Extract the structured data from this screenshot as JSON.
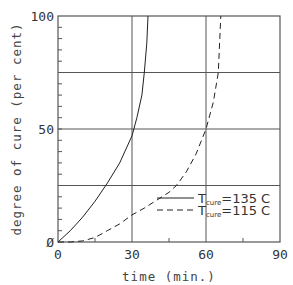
{
  "chart_data": {
    "type": "line",
    "title": "",
    "xlabel": "time (min.)",
    "ylabel": "degree of cure (per cent)",
    "xlim": [
      0,
      90
    ],
    "ylim": [
      0,
      100
    ],
    "x_ticks": [
      0,
      30,
      60,
      90
    ],
    "x_tick_labels": [
      "0",
      "30",
      "60",
      "90"
    ],
    "x_minor_ticks": [
      15,
      45,
      75
    ],
    "y_ticks": [
      0,
      50,
      100
    ],
    "y_tick_labels": [
      "Ø",
      "50",
      "100"
    ],
    "y_minor_step": 5,
    "grid": {
      "x": [
        30,
        60
      ],
      "y": [
        25,
        50,
        75
      ]
    },
    "legend_position": "lower right",
    "series": [
      {
        "name": "T_cure=135 C",
        "label_main": "T",
        "label_sub": "cure",
        "label_rest": "=135 C",
        "style": "solid",
        "x": [
          0,
          5,
          10,
          15,
          20,
          25,
          30,
          32,
          34,
          35,
          36,
          36.5
        ],
        "y": [
          0,
          5,
          11,
          18,
          26,
          35,
          47,
          55,
          65,
          75,
          88,
          100
        ]
      },
      {
        "name": "T_cure=115 C",
        "label_main": "T",
        "label_sub": "cure",
        "label_rest": "=115 C",
        "style": "dashed",
        "x": [
          0,
          5,
          10,
          15,
          20,
          25,
          30,
          35,
          40,
          45,
          48,
          52,
          56,
          60,
          63,
          65,
          66
        ],
        "y": [
          0,
          0,
          0.5,
          2,
          5,
          8,
          12,
          15,
          18.5,
          22,
          25,
          31,
          39,
          50,
          62,
          75,
          100
        ]
      }
    ]
  },
  "colors": {
    "axis": "#555555",
    "grid": "#555555",
    "line": "#222222",
    "background": "#ffffff"
  }
}
